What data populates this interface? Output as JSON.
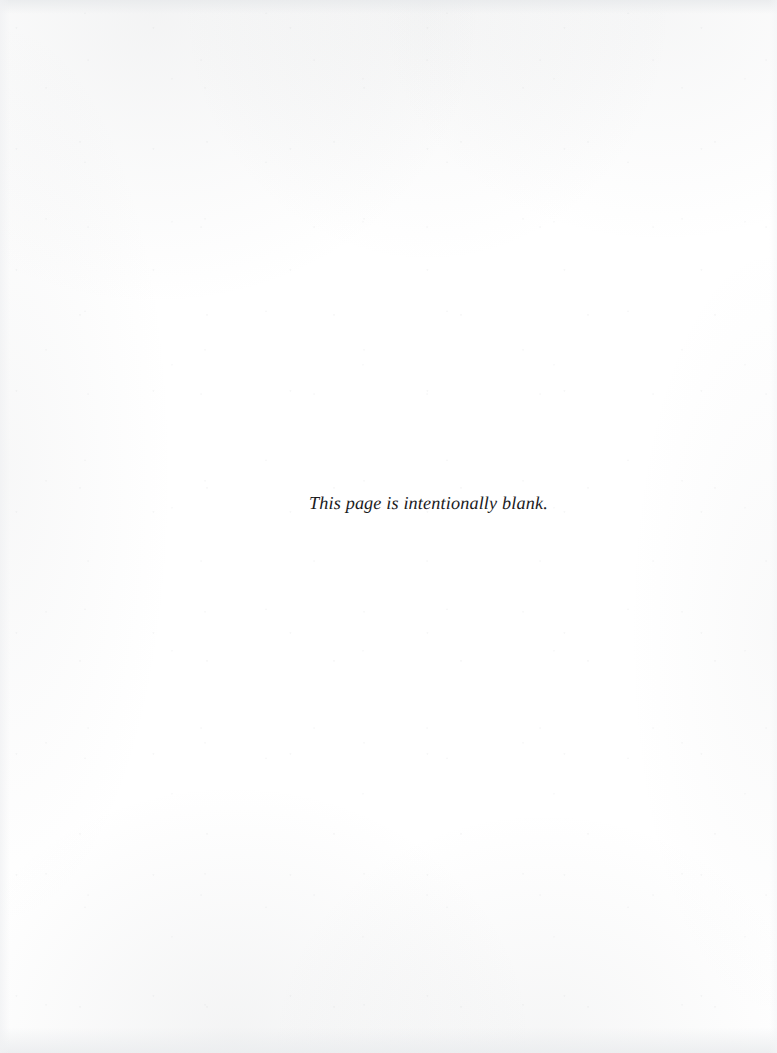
{
  "page": {
    "width_px": 777,
    "height_px": 1053,
    "background_color": "#ffffff",
    "media_type": "scanned-printed-page",
    "content_summary": "blank-page-notice"
  },
  "notice": {
    "text": "This page is intentionally blank.",
    "style": "italic-serif",
    "color": "#1b1b1d",
    "align": "center",
    "position": {
      "left_px": 309,
      "baseline_y_px": 508,
      "width_px": 226,
      "center_x_px": 422
    }
  },
  "texture": {
    "top_band_color": "#e8eaec",
    "bottom_band_color": "#ebedef",
    "left_band_color": "#f0f1f3",
    "right_band_color": "#f3f4f6"
  }
}
